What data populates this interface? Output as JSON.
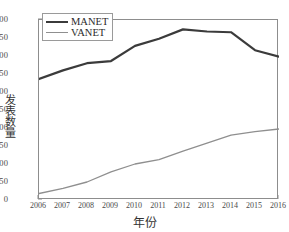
{
  "chart_data": {
    "type": "line",
    "title": "",
    "xlabel": "年份",
    "ylabel": "发表数量",
    "x": [
      2006,
      2007,
      2008,
      2009,
      2010,
      2011,
      2012,
      2013,
      2014,
      2015,
      2016
    ],
    "xtick_labels": [
      "2006",
      "2007",
      "2008",
      "2009",
      "2010",
      "2011",
      "2012",
      "2013",
      "2014",
      "2015",
      "2016"
    ],
    "ytick_labels": [
      "0",
      "1250",
      "2500",
      "3750",
      "5000",
      "6250",
      "7500",
      "8750",
      "10000",
      "11250",
      "12500"
    ],
    "ytick_values": [
      0,
      1250,
      2500,
      3750,
      5000,
      6250,
      7500,
      8750,
      10000,
      11250,
      12500
    ],
    "xlim": [
      2006,
      2016
    ],
    "ylim": [
      0,
      12500
    ],
    "grid": false,
    "legend_position": "upper-left",
    "series": [
      {
        "name": "MANET",
        "color": "#3b3b3b",
        "width": 2.2,
        "values": [
          8400,
          9000,
          9500,
          9650,
          10700,
          11200,
          11850,
          11700,
          11650,
          10400,
          9950
        ]
      },
      {
        "name": "VANET",
        "color": "#8f8f8f",
        "width": 1.3,
        "values": [
          450,
          800,
          1250,
          1950,
          2500,
          2800,
          3400,
          3950,
          4500,
          4750,
          4930
        ]
      }
    ]
  },
  "legend": {
    "entries": [
      {
        "label": "MANET"
      },
      {
        "label": "VANET"
      }
    ]
  }
}
